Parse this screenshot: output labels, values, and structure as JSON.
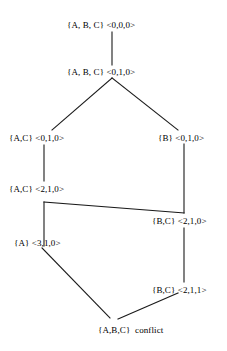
{
  "diagram": {
    "nodes": [
      {
        "id": "n0",
        "set": "{A, B, C}",
        "vector": "<0,0,0>",
        "tag": "",
        "label": "{A, B, C} <0,0,0>",
        "x": 67,
        "y": 20
      },
      {
        "id": "n1",
        "set": "{A, B, C}",
        "vector": "<0,1,0>",
        "tag": "",
        "label": "{A, B, C} <0,1,0>",
        "x": 67,
        "y": 67
      },
      {
        "id": "n2",
        "set": "{A,C}",
        "vector": "<0,1,0>",
        "tag": "",
        "label": "{A,C} <0,1,0>",
        "x": 9,
        "y": 133
      },
      {
        "id": "n3",
        "set": "{B}",
        "vector": "<0,1,0>",
        "tag": "",
        "label": "{B} <0,1,0>",
        "x": 158,
        "y": 133
      },
      {
        "id": "n4",
        "set": "{A,C}",
        "vector": "<2,1,0>",
        "tag": "",
        "label": "{A,C} <2,1,0>",
        "x": 9,
        "y": 184
      },
      {
        "id": "n5",
        "set": "{B,C}",
        "vector": "<2,1,0>",
        "tag": "",
        "label": "{B,C} <2,1,0>",
        "x": 152,
        "y": 216
      },
      {
        "id": "n6",
        "set": "{A}",
        "vector": "<3,1,0>",
        "tag": "",
        "label": "{A} <3,1,0>",
        "x": 14,
        "y": 238
      },
      {
        "id": "n7",
        "set": "{B,C}",
        "vector": "<2,1,1>",
        "tag": "",
        "label": "{B,C} <2,1,1>",
        "x": 152,
        "y": 285
      },
      {
        "id": "n8",
        "set": "{A,B,C}",
        "vector": "",
        "tag": "conflict",
        "label": "{A,B,C}  conflict",
        "x": 98,
        "y": 325
      }
    ],
    "edges": [
      {
        "id": "e0",
        "from": "n0",
        "to": "n1",
        "points": "112,32 112,65"
      },
      {
        "id": "e1",
        "from": "n1",
        "to": "n2",
        "points": "112,78 52,130"
      },
      {
        "id": "e2",
        "from": "n1",
        "to": "n3",
        "points": "112,78 178,130"
      },
      {
        "id": "e3",
        "from": "n2",
        "to": "n4",
        "points": "44,145 44,181"
      },
      {
        "id": "e4",
        "from": "n3",
        "to": "n5",
        "points": "184,144 184,213"
      },
      {
        "id": "e5",
        "from": "n4",
        "to": "n5",
        "points": "44,202 184,213"
      },
      {
        "id": "e6",
        "from": "n4",
        "to": "n6",
        "points": "44,202 44,246"
      },
      {
        "id": "e7",
        "from": "n5",
        "to": "n7",
        "points": "184,228 184,282"
      },
      {
        "id": "e8",
        "from": "n6",
        "to": "n8",
        "points": "42,248 110,318"
      },
      {
        "id": "e9",
        "from": "n7",
        "to": "n8",
        "points": "178,293 118,319"
      }
    ],
    "colors": {
      "background": "#ffffff",
      "stroke": "#1a1a1a",
      "text": "#000000"
    }
  }
}
